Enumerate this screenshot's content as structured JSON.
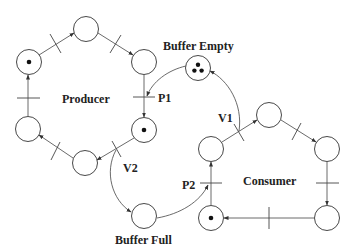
{
  "diagram": {
    "type": "petri-net",
    "labels": {
      "producer": "Producer",
      "consumer": "Consumer",
      "buffer_empty": "Buffer Empty",
      "buffer_full": "Buffer Full",
      "p1": "P1",
      "p2": "P2",
      "v1": "V1",
      "v2": "V2"
    },
    "places": [
      {
        "id": "prod-top",
        "x": 86,
        "y": 29,
        "tokens": 0
      },
      {
        "id": "prod-top-left",
        "x": 29,
        "y": 62,
        "tokens": 1
      },
      {
        "id": "prod-top-right",
        "x": 144,
        "y": 62,
        "tokens": 0
      },
      {
        "id": "prod-bottom-left",
        "x": 28,
        "y": 129,
        "tokens": 0
      },
      {
        "id": "prod-bottom-right",
        "x": 144,
        "y": 130,
        "tokens": 1
      },
      {
        "id": "prod-bottom",
        "x": 85,
        "y": 163,
        "tokens": 0
      },
      {
        "id": "buffer-empty",
        "x": 198,
        "y": 68,
        "tokens": 3
      },
      {
        "id": "buffer-full",
        "x": 144,
        "y": 216,
        "tokens": 0
      },
      {
        "id": "cons-top",
        "x": 269,
        "y": 115,
        "tokens": 0
      },
      {
        "id": "cons-top-left",
        "x": 211,
        "y": 149,
        "tokens": 0
      },
      {
        "id": "cons-top-right",
        "x": 327,
        "y": 149,
        "tokens": 0
      },
      {
        "id": "cons-bottom-left",
        "x": 211,
        "y": 218,
        "tokens": 1
      },
      {
        "id": "cons-bottom-right",
        "x": 327,
        "y": 218,
        "tokens": 0
      }
    ],
    "colors": {
      "stroke": "#333333",
      "token": "#111111",
      "background": "#ffffff"
    }
  }
}
